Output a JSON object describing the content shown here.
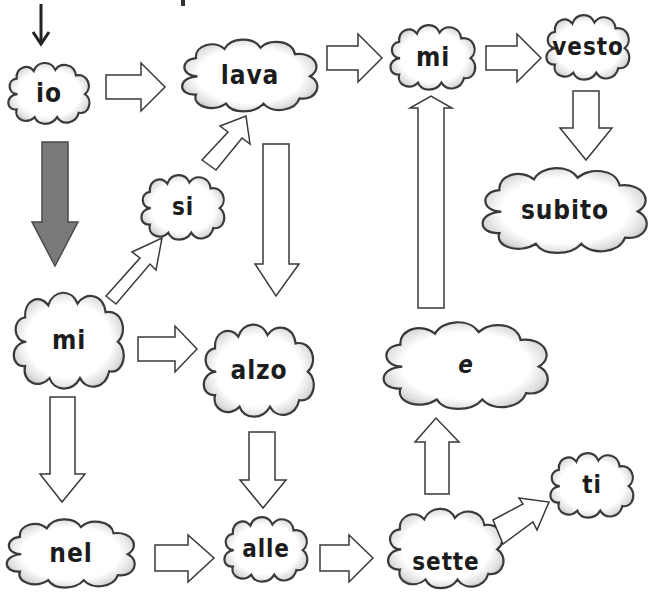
{
  "diagram": {
    "background": "#ffffff",
    "stroke_color": "#3a3a3a",
    "gray_arrow_color": "#7a7a7a",
    "start_arrow_color": "#222222",
    "nodes": [
      {
        "id": "io",
        "label": "io"
      },
      {
        "id": "lava",
        "label": "lava"
      },
      {
        "id": "mi_top",
        "label": "mi"
      },
      {
        "id": "vesto",
        "label": "vesto"
      },
      {
        "id": "subito",
        "label": "subito"
      },
      {
        "id": "si",
        "label": "si"
      },
      {
        "id": "mi_left",
        "label": "mi"
      },
      {
        "id": "alzo",
        "label": "alzo"
      },
      {
        "id": "e",
        "label": "e"
      },
      {
        "id": "nel",
        "label": "nel"
      },
      {
        "id": "alle",
        "label": "alle"
      },
      {
        "id": "sette",
        "label": "sette"
      },
      {
        "id": "ti",
        "label": "ti"
      }
    ],
    "edges": [
      {
        "from": "start",
        "to": "io",
        "style": "thin-black"
      },
      {
        "from": "io",
        "to": "lava",
        "style": "outline"
      },
      {
        "from": "lava",
        "to": "mi_top",
        "style": "outline"
      },
      {
        "from": "mi_top",
        "to": "vesto",
        "style": "outline"
      },
      {
        "from": "vesto",
        "to": "subito",
        "style": "outline"
      },
      {
        "from": "io",
        "to": "mi_left",
        "style": "gray-filled"
      },
      {
        "from": "mi_left",
        "to": "si",
        "style": "outline"
      },
      {
        "from": "si",
        "to": "lava",
        "style": "outline"
      },
      {
        "from": "lava",
        "to": "alzo",
        "style": "outline"
      },
      {
        "from": "mi_left",
        "to": "alzo",
        "style": "outline"
      },
      {
        "from": "mi_left",
        "to": "nel",
        "style": "outline"
      },
      {
        "from": "alzo",
        "to": "alle",
        "style": "outline"
      },
      {
        "from": "nel",
        "to": "alle",
        "style": "outline"
      },
      {
        "from": "alle",
        "to": "sette",
        "style": "outline"
      },
      {
        "from": "sette",
        "to": "e",
        "style": "outline"
      },
      {
        "from": "e",
        "to": "mi_top",
        "style": "outline"
      },
      {
        "from": "sette",
        "to": "ti",
        "style": "outline"
      }
    ]
  }
}
